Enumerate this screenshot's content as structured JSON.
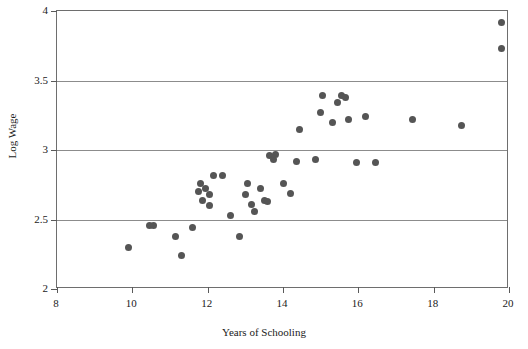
{
  "chart_data": {
    "type": "scatter",
    "title": "",
    "xlabel": "Years of Schooling",
    "ylabel": "Log Wage",
    "xlim": [
      8,
      20
    ],
    "ylim": [
      2,
      4
    ],
    "xticks": [
      "8",
      "10",
      "12",
      "14",
      "16",
      "18",
      "20"
    ],
    "xtick_values": [
      8,
      10,
      12,
      14,
      16,
      18,
      20
    ],
    "yticks": [
      "2",
      "2.5",
      "3",
      "3.5",
      "4"
    ],
    "ytick_values": [
      2,
      2.5,
      3,
      3.5,
      4
    ],
    "grid": "horizontal",
    "gridlines_at": [
      2.5,
      3,
      3.5
    ],
    "legend": "none",
    "marker_color": "#555555",
    "marker_size_px": 7,
    "series": [
      {
        "name": "Observations",
        "points": [
          [
            9.9,
            2.3
          ],
          [
            10.45,
            2.46
          ],
          [
            10.55,
            2.46
          ],
          [
            11.15,
            2.38
          ],
          [
            11.3,
            2.24
          ],
          [
            11.6,
            2.44
          ],
          [
            11.75,
            2.7
          ],
          [
            11.8,
            2.76
          ],
          [
            11.85,
            2.64
          ],
          [
            11.95,
            2.72
          ],
          [
            12.05,
            2.68
          ],
          [
            12.05,
            2.6
          ],
          [
            12.15,
            2.82
          ],
          [
            12.4,
            2.82
          ],
          [
            12.6,
            2.53
          ],
          [
            12.85,
            2.38
          ],
          [
            13.0,
            2.68
          ],
          [
            13.05,
            2.76
          ],
          [
            13.15,
            2.61
          ],
          [
            13.25,
            2.56
          ],
          [
            13.4,
            2.72
          ],
          [
            13.5,
            2.64
          ],
          [
            13.6,
            2.63
          ],
          [
            13.65,
            2.96
          ],
          [
            13.75,
            2.93
          ],
          [
            13.8,
            2.97
          ],
          [
            14.0,
            2.76
          ],
          [
            14.2,
            2.69
          ],
          [
            14.35,
            2.92
          ],
          [
            14.45,
            3.15
          ],
          [
            14.85,
            2.93
          ],
          [
            15.0,
            3.27
          ],
          [
            15.05,
            3.39
          ],
          [
            15.3,
            3.2
          ],
          [
            15.45,
            3.34
          ],
          [
            15.55,
            3.39
          ],
          [
            15.65,
            3.38
          ],
          [
            15.75,
            3.22
          ],
          [
            15.95,
            2.91
          ],
          [
            16.2,
            3.24
          ],
          [
            16.45,
            2.91
          ],
          [
            17.45,
            3.22
          ],
          [
            18.75,
            3.18
          ],
          [
            19.8,
            3.92
          ],
          [
            19.8,
            3.73
          ]
        ]
      }
    ]
  }
}
